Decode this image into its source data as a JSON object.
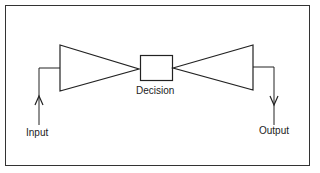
{
  "diagram": {
    "type": "block-diagram",
    "labels": {
      "input": "Input",
      "decision": "Decision",
      "output": "Output"
    },
    "nodes": [
      {
        "id": "input-funnel",
        "shape": "triangle-converging"
      },
      {
        "id": "decision",
        "shape": "rectangle",
        "label": "Decision"
      },
      {
        "id": "output-funnel",
        "shape": "triangle-diverging"
      }
    ],
    "edges": [
      {
        "from": "Input",
        "to": "input-funnel"
      },
      {
        "from": "input-funnel",
        "to": "decision"
      },
      {
        "from": "decision",
        "to": "output-funnel"
      },
      {
        "from": "output-funnel",
        "to": "Output"
      }
    ],
    "stroke_color": "#222222"
  }
}
